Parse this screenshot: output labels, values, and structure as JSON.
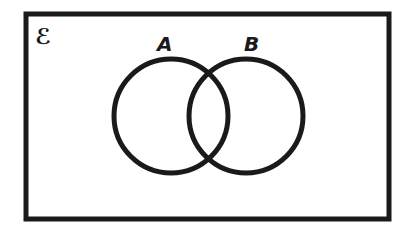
{
  "diagram": {
    "type": "venn",
    "universal_set": {
      "label": "ℰ"
    },
    "sets": [
      {
        "label": "A"
      },
      {
        "label": "B"
      }
    ],
    "colors": {
      "stroke": "#1a1a1a",
      "background": "#ffffff"
    }
  }
}
